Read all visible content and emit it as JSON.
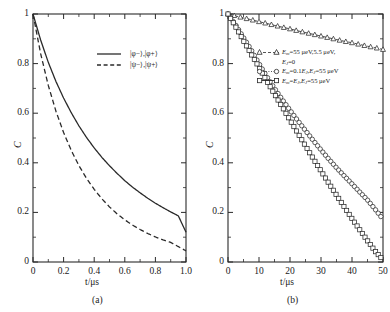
{
  "figure": {
    "caption_a": "(a)",
    "caption_b": "(b)"
  },
  "panel_a": {
    "xlabel": "t/μs",
    "ylabel": "C",
    "xticks": [
      "0",
      "0.2",
      "0.4",
      "0.6",
      "0.8",
      "1.0"
    ],
    "yticks": [
      "0",
      "0.2",
      "0.4",
      "0.6",
      "0.8",
      "1"
    ],
    "legend": [
      {
        "style": "solid",
        "label": "|φ−⟩,|φ+⟩"
      },
      {
        "style": "dashed",
        "label": "|ψ−⟩,|ψ+⟩"
      }
    ]
  },
  "panel_b": {
    "xlabel": "t/μs",
    "ylabel": "C",
    "xticks": [
      "0",
      "10",
      "20",
      "30",
      "40",
      "50"
    ],
    "yticks": [
      "0",
      "0.2",
      "0.4",
      "0.6",
      "0.8",
      "1"
    ],
    "legend": [
      {
        "marker": "triangle",
        "style": "dashed",
        "line1": "Em=55 μeV,5.5 μeV,",
        "line2": "EJ=0"
      },
      {
        "marker": "circle",
        "style": "dotted",
        "line1": "Em=0.1EJ,EJ=55 μeV",
        "line2": ""
      },
      {
        "marker": "square",
        "style": "solid",
        "line1": "Em=EJ,EJ=55 μeV",
        "line2": ""
      }
    ]
  },
  "chart_data": [
    {
      "type": "line",
      "panel": "(a)",
      "title": "",
      "xlabel": "t/μs",
      "ylabel": "C",
      "xlim": [
        0,
        1.0
      ],
      "ylim": [
        0,
        1
      ],
      "xticks": [
        0,
        0.2,
        0.4,
        0.6,
        0.8,
        1.0
      ],
      "yticks": [
        0,
        0.2,
        0.4,
        0.6,
        0.8,
        1
      ],
      "grid": false,
      "legend_position": "upper-right",
      "series": [
        {
          "name": "|φ−⟩,|φ+⟩",
          "style": "solid",
          "x": [
            0,
            0.05,
            0.1,
            0.15,
            0.2,
            0.25,
            0.3,
            0.35,
            0.4,
            0.45,
            0.5,
            0.55,
            0.6,
            0.65,
            0.7,
            0.75,
            0.8,
            0.85,
            0.9,
            0.95,
            1.0
          ],
          "values": [
            1.0,
            0.895,
            0.805,
            0.728,
            0.661,
            0.602,
            0.549,
            0.502,
            0.46,
            0.422,
            0.388,
            0.357,
            0.328,
            0.302,
            0.279,
            0.257,
            0.237,
            0.219,
            0.202,
            0.186,
            0.12
          ]
        },
        {
          "name": "|ψ−⟩,|ψ+⟩",
          "style": "dashed",
          "x": [
            0,
            0.05,
            0.1,
            0.15,
            0.2,
            0.25,
            0.3,
            0.35,
            0.4,
            0.45,
            0.5,
            0.55,
            0.6,
            0.65,
            0.7,
            0.75,
            0.8,
            0.85,
            0.9,
            0.95,
            1.0
          ],
          "values": [
            1.0,
            0.84,
            0.712,
            0.608,
            0.522,
            0.45,
            0.389,
            0.337,
            0.293,
            0.255,
            0.222,
            0.194,
            0.17,
            0.149,
            0.131,
            0.115,
            0.101,
            0.089,
            0.079,
            0.062,
            0.045
          ]
        }
      ]
    },
    {
      "type": "line",
      "panel": "(b)",
      "title": "",
      "xlabel": "t/μs",
      "ylabel": "C",
      "xlim": [
        0,
        50
      ],
      "ylim": [
        0,
        1
      ],
      "xticks": [
        0,
        10,
        20,
        30,
        40,
        50
      ],
      "yticks": [
        0,
        0.2,
        0.4,
        0.6,
        0.8,
        1
      ],
      "grid": false,
      "legend_position": "upper-right",
      "series": [
        {
          "name": "Em=55 μeV,5.5 μeV, EJ=0",
          "marker": "triangle",
          "style": "dashed",
          "x": [
            0,
            2.5,
            5,
            7.5,
            10,
            12.5,
            15,
            17.5,
            20,
            22.5,
            25,
            27.5,
            30,
            32.5,
            35,
            37.5,
            40,
            42.5,
            45,
            47.5,
            50
          ],
          "values": [
            1.0,
            0.992,
            0.984,
            0.977,
            0.969,
            0.962,
            0.954,
            0.947,
            0.94,
            0.932,
            0.925,
            0.918,
            0.911,
            0.904,
            0.897,
            0.89,
            0.884,
            0.877,
            0.87,
            0.864,
            0.857
          ]
        },
        {
          "name": "Em=0.1EJ,EJ=55 μeV",
          "marker": "circle",
          "style": "dotted",
          "x": [
            0,
            2.5,
            5,
            7.5,
            10,
            12.5,
            15,
            17.5,
            20,
            22.5,
            25,
            27.5,
            30,
            32.5,
            35,
            37.5,
            40,
            42.5,
            45,
            47.5,
            50
          ],
          "values": [
            1.0,
            0.955,
            0.905,
            0.855,
            0.8,
            0.748,
            0.7,
            0.655,
            0.612,
            0.57,
            0.53,
            0.49,
            0.452,
            0.415,
            0.38,
            0.347,
            0.315,
            0.282,
            0.25,
            0.212,
            0.172
          ]
        },
        {
          "name": "Em=EJ,EJ=55 μeV",
          "marker": "square",
          "style": "solid",
          "x": [
            0,
            2.5,
            5,
            7.5,
            10,
            12.5,
            15,
            17.5,
            20,
            22.5,
            25,
            27.5,
            30,
            32.5,
            35,
            37.5,
            40,
            42.5,
            45,
            47.5,
            50
          ],
          "values": [
            1.0,
            0.948,
            0.892,
            0.838,
            0.785,
            0.73,
            0.677,
            0.625,
            0.572,
            0.52,
            0.468,
            0.417,
            0.367,
            0.318,
            0.27,
            0.222,
            0.175,
            0.13,
            0.086,
            0.043,
            0.008
          ]
        }
      ]
    }
  ]
}
